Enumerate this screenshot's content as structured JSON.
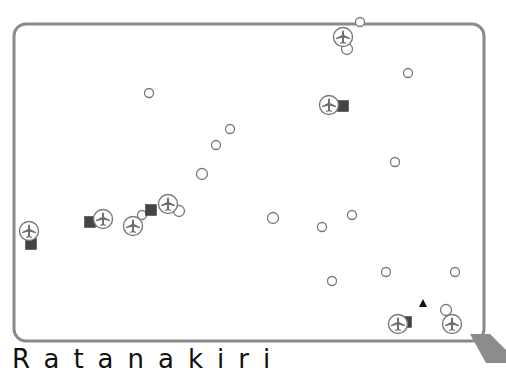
{
  "map": {
    "frame": {
      "x": 14,
      "y": 24,
      "width": 470,
      "height": 317,
      "radius": 12,
      "stroke": "#8a8a8a"
    },
    "pointer": {
      "points": "470,334 492,334 506,350 506,363 488,363",
      "color": "#8c8c8c"
    },
    "legend_symbols": {
      "circle": "point-of-interest",
      "airport": "airport-icon",
      "square": "station-icon",
      "triangle": "peak-icon"
    },
    "circles": [
      {
        "x": 360,
        "y": 22,
        "r": 4.5
      },
      {
        "x": 149,
        "y": 93,
        "r": 4.5
      },
      {
        "x": 408,
        "y": 73,
        "r": 4.5
      },
      {
        "x": 230,
        "y": 129,
        "r": 4.5
      },
      {
        "x": 216,
        "y": 145,
        "r": 4.5
      },
      {
        "x": 395,
        "y": 162,
        "r": 4.5
      },
      {
        "x": 202,
        "y": 174,
        "r": 5.5
      },
      {
        "x": 179,
        "y": 211,
        "r": 5.5
      },
      {
        "x": 142,
        "y": 215,
        "r": 4.5
      },
      {
        "x": 273,
        "y": 218,
        "r": 5.5
      },
      {
        "x": 352,
        "y": 215,
        "r": 4.5
      },
      {
        "x": 322,
        "y": 227,
        "r": 4.5
      },
      {
        "x": 386,
        "y": 272,
        "r": 4.5
      },
      {
        "x": 455,
        "y": 272,
        "r": 4.5
      },
      {
        "x": 332,
        "y": 281,
        "r": 4.5
      },
      {
        "x": 446,
        "y": 310,
        "r": 5.5
      },
      {
        "x": 347,
        "y": 49,
        "r": 5.5
      }
    ],
    "airports": [
      {
        "x": 343,
        "y": 37
      },
      {
        "x": 329,
        "y": 105
      },
      {
        "x": 29,
        "y": 231
      },
      {
        "x": 103,
        "y": 219
      },
      {
        "x": 133,
        "y": 226
      },
      {
        "x": 168,
        "y": 204
      },
      {
        "x": 398,
        "y": 324
      },
      {
        "x": 452,
        "y": 324
      }
    ],
    "squares": [
      {
        "x": 343,
        "y": 106,
        "size": 11
      },
      {
        "x": 31,
        "y": 244,
        "size": 11
      },
      {
        "x": 90,
        "y": 222,
        "size": 11
      },
      {
        "x": 151,
        "y": 210,
        "size": 11
      },
      {
        "x": 406,
        "y": 322,
        "size": 11
      }
    ],
    "triangles": [
      {
        "x": 423,
        "y": 303,
        "size": 8
      }
    ]
  },
  "caption": {
    "text": "Ratanakiri"
  }
}
